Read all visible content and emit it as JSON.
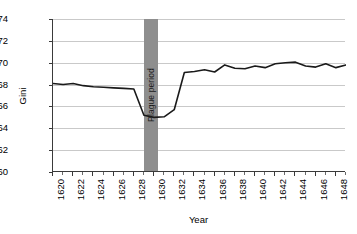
{
  "chart_data": {
    "type": "line",
    "title": "",
    "xlabel": "Year",
    "ylabel": "Gini",
    "xlim": [
      1620,
      1649
    ],
    "ylim": [
      60,
      74
    ],
    "y_ticks": [
      60,
      62,
      64,
      66,
      68,
      70,
      72,
      74
    ],
    "x_ticks": [
      1620,
      1622,
      1624,
      1626,
      1628,
      1630,
      1632,
      1634,
      1636,
      1638,
      1640,
      1642,
      1644,
      1646,
      1648
    ],
    "grid": "horizontal",
    "legend": "none",
    "line_color": "#1a1a1a",
    "annotations": [
      {
        "label": "Plague period",
        "type": "vertical-band",
        "x_start": 1629,
        "x_end": 1630.4,
        "color": "#8e8e8e"
      }
    ],
    "x": [
      1620,
      1621,
      1622,
      1623,
      1624,
      1625,
      1626,
      1627,
      1628,
      1629,
      1630,
      1631,
      1632,
      1633,
      1634,
      1635,
      1636,
      1637,
      1638,
      1639,
      1640,
      1641,
      1642,
      1643,
      1644,
      1645,
      1646,
      1647,
      1648,
      1649
    ],
    "values": [
      68.1,
      68.0,
      68.1,
      67.9,
      67.8,
      67.75,
      67.7,
      67.65,
      67.6,
      65.2,
      65.0,
      65.05,
      65.7,
      69.1,
      69.2,
      69.35,
      69.15,
      69.8,
      69.5,
      69.45,
      69.7,
      69.55,
      69.9,
      70.0,
      70.05,
      69.7,
      69.6,
      69.9,
      69.55,
      69.8
    ],
    "series_name": "Gini"
  },
  "axis": {
    "y_title": "Gini",
    "x_title": "Year"
  },
  "band": {
    "label": "Plague period"
  }
}
